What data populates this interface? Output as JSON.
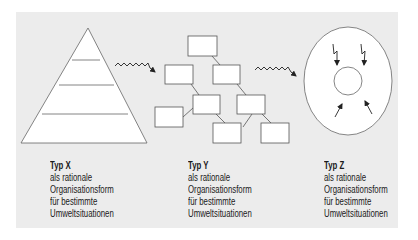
{
  "colors": {
    "background": "#ffffff",
    "panel": "#ececec",
    "shape_fill": "#ffffff",
    "stroke": "#555555",
    "arrow": "#222222",
    "text": "#1a1a1a"
  },
  "types": [
    {
      "id": "x",
      "shape": "pyramid",
      "title": "Typ X",
      "lines": [
        "als rationale",
        "Organisationsform",
        "für bestimmte",
        "Umweltsituationen"
      ]
    },
    {
      "id": "y",
      "shape": "network-of-boxes",
      "title": "Typ Y",
      "lines": [
        "als rationale",
        "Organisationsform",
        "für bestimmte",
        "Umweltsituationen"
      ]
    },
    {
      "id": "z",
      "shape": "circle-with-core",
      "title": "Typ Z",
      "lines": [
        "als rationale",
        "Organisationsform",
        "für bestimmte",
        "Umweltsituationen"
      ]
    }
  ],
  "connectors": [
    {
      "from": "x",
      "to": "y",
      "style": "wavy-arrow"
    },
    {
      "from": "y",
      "to": "z",
      "style": "wavy-arrow"
    }
  ],
  "icons": {
    "transition": "wavy-arrow-icon",
    "disturbance": "lightning-arrow-icon",
    "pressure": "inward-arrow-icon"
  }
}
